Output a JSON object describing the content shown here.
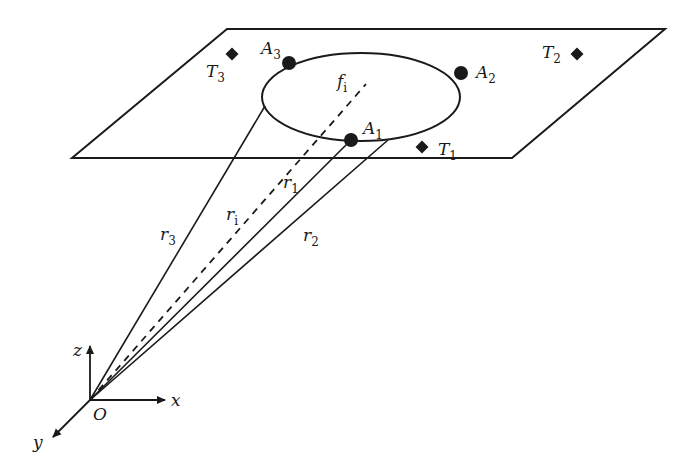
{
  "diagram": {
    "plane": {
      "points": [
        [
          227,
          29
        ],
        [
          665,
          29
        ],
        [
          512,
          158
        ],
        [
          72,
          158
        ]
      ]
    },
    "ellipse": {
      "cx": 361,
      "cy": 97,
      "rx": 99,
      "ry": 44
    },
    "anchors": [
      {
        "id": "A1",
        "base": "A",
        "sub": "1",
        "x": 351,
        "y": 140,
        "label_x": 363,
        "label_y": 134
      },
      {
        "id": "A2",
        "base": "A",
        "sub": "2",
        "x": 461,
        "y": 73,
        "label_x": 476,
        "label_y": 78
      },
      {
        "id": "A3",
        "base": "A",
        "sub": "3",
        "x": 289,
        "y": 63,
        "label_x": 261,
        "label_y": 54
      }
    ],
    "tags": [
      {
        "id": "T1",
        "base": "T",
        "sub": "1",
        "x": 422,
        "y": 147,
        "label_x": 438,
        "label_y": 155
      },
      {
        "id": "T2",
        "base": "T",
        "sub": "2",
        "x": 577,
        "y": 54,
        "label_x": 542,
        "label_y": 58
      },
      {
        "id": "T3",
        "base": "T",
        "sub": "3",
        "x": 232,
        "y": 54,
        "label_x": 206,
        "label_y": 77
      }
    ],
    "focus": {
      "base": "f",
      "sub": "i",
      "label_x": 337,
      "label_y": 87
    },
    "origin": {
      "label": "O",
      "x": 90,
      "y": 400,
      "label_x": 93,
      "label_y": 420
    },
    "rays": [
      {
        "id": "r1",
        "base": "r",
        "sub": "1",
        "to": [
          351,
          140
        ],
        "dashed": false,
        "label_x": 283,
        "label_y": 188
      },
      {
        "id": "r2",
        "base": "r",
        "sub": "2",
        "to": [
          388,
          140
        ],
        "dashed": false,
        "label_x": 303,
        "label_y": 241
      },
      {
        "id": "r3",
        "base": "r",
        "sub": "3",
        "to": [
          265,
          106
        ],
        "dashed": false,
        "label_x": 160,
        "label_y": 240
      },
      {
        "id": "ri",
        "base": "r",
        "sub": "i",
        "to": [
          366,
          84
        ],
        "dashed": true,
        "label_x": 226,
        "label_y": 220
      }
    ],
    "axes": [
      {
        "id": "x",
        "label": "x",
        "to": [
          165,
          400
        ],
        "label_x": 171,
        "label_y": 406
      },
      {
        "id": "y",
        "label": "y",
        "to": [
          53,
          437
        ],
        "label_x": 33,
        "label_y": 448
      },
      {
        "id": "z",
        "label": "z",
        "to": [
          90,
          346
        ],
        "label_x": 73,
        "label_y": 356
      }
    ],
    "colors": {
      "stroke": "#1a1a1a",
      "background": "#ffffff"
    }
  }
}
